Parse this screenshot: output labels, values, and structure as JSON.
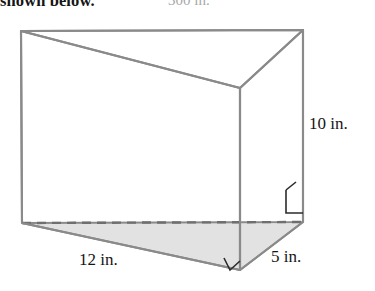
{
  "page": {
    "prompt_fragment": "shown below.",
    "answer_fragment": "300 in."
  },
  "figure": {
    "name": "triangular-prism",
    "stroke_color": "#8a8a8a",
    "base_fill_color": "#e2e2e2",
    "labels": {
      "height": "10 in.",
      "length": "12 in.",
      "depth": "5 in."
    },
    "measurements": [
      {
        "name": "height",
        "value": 10,
        "unit": "in."
      },
      {
        "name": "length",
        "value": 12,
        "unit": "in."
      },
      {
        "name": "depth",
        "value": 5,
        "unit": "in."
      }
    ],
    "vertices": {
      "top_back_left": [
        21,
        31
      ],
      "top_back_right": [
        303,
        30
      ],
      "top_front": [
        240,
        88
      ],
      "bottom_back_left": [
        22,
        223
      ],
      "bottom_back_right": [
        303,
        222
      ],
      "bottom_front": [
        240,
        270
      ]
    },
    "right_angle_markers": [
      {
        "name": "base-front-right-angle",
        "at": [
          240,
          270
        ]
      },
      {
        "name": "side-bottom-right-angle",
        "at": [
          303,
          222
        ]
      }
    ]
  }
}
